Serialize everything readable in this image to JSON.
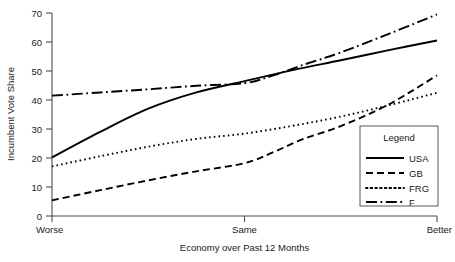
{
  "chart_data": {
    "type": "line",
    "title": "",
    "xlabel": "Economy over Past 12 Months",
    "ylabel": "Incumbent Vote Share",
    "categories": [
      "Worse",
      "Same",
      "Better"
    ],
    "x": [
      0,
      1,
      2
    ],
    "xtick_labels": [
      "Worse",
      "Same",
      "Better"
    ],
    "ytick_labels": [
      "0",
      "10",
      "20",
      "30",
      "40",
      "50",
      "60",
      "70"
    ],
    "yticks": [
      0,
      10,
      20,
      30,
      40,
      50,
      60,
      70
    ],
    "ylim": [
      0,
      70
    ],
    "xlim": [
      0,
      2
    ],
    "grid": false,
    "legend_position": "lower right",
    "legend_title": "Legend",
    "series": [
      {
        "name": "USA",
        "style": "solid",
        "values": [
          20.2,
          46.5,
          60.5
        ],
        "points": [
          [
            0.0,
            20.2
          ],
          [
            0.25,
            29.0
          ],
          [
            0.5,
            37.0
          ],
          [
            0.75,
            42.6
          ],
          [
            1.0,
            46.5
          ],
          [
            1.25,
            50.3
          ],
          [
            1.5,
            53.7
          ],
          [
            1.75,
            57.2
          ],
          [
            2.0,
            60.5
          ]
        ]
      },
      {
        "name": "GB",
        "style": "dashed",
        "values": [
          5.4,
          18.2,
          48.5
        ],
        "points": [
          [
            0.0,
            5.4
          ],
          [
            0.25,
            8.9
          ],
          [
            0.5,
            12.3
          ],
          [
            0.75,
            15.4
          ],
          [
            1.0,
            18.2
          ],
          [
            1.15,
            22.0
          ],
          [
            1.3,
            26.4
          ],
          [
            1.5,
            31.0
          ],
          [
            1.75,
            38.5
          ],
          [
            2.0,
            48.5
          ]
        ]
      },
      {
        "name": "FRG",
        "style": "dotted",
        "values": [
          17.1,
          28.4,
          42.5
        ],
        "points": [
          [
            0.0,
            17.1
          ],
          [
            0.25,
            20.6
          ],
          [
            0.5,
            23.9
          ],
          [
            0.75,
            26.6
          ],
          [
            1.0,
            28.4
          ],
          [
            1.25,
            31.1
          ],
          [
            1.5,
            34.3
          ],
          [
            1.75,
            38.2
          ],
          [
            2.0,
            42.5
          ]
        ]
      },
      {
        "name": "F",
        "style": "dashdot",
        "values": [
          41.5,
          45.8,
          69.5
        ],
        "points": [
          [
            0.0,
            41.5
          ],
          [
            0.25,
            42.6
          ],
          [
            0.5,
            43.7
          ],
          [
            0.75,
            44.9
          ],
          [
            1.0,
            45.8
          ],
          [
            1.15,
            48.5
          ],
          [
            1.3,
            52.0
          ],
          [
            1.5,
            56.4
          ],
          [
            1.75,
            62.8
          ],
          [
            2.0,
            69.5
          ]
        ]
      }
    ],
    "legend_entries": [
      {
        "label": "USA",
        "style": "solid"
      },
      {
        "label": "GB",
        "style": "dashed"
      },
      {
        "label": "FRG",
        "style": "dotted"
      },
      {
        "label": "F",
        "style": "dashdot"
      }
    ]
  },
  "axis": {
    "y_title": "Incumbent Vote Share",
    "x_title": "Economy over Past 12 Months"
  }
}
